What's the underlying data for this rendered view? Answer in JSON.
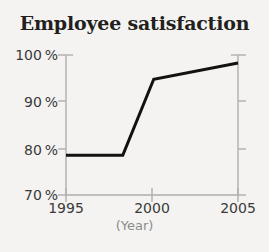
{
  "chart_data": {
    "type": "line",
    "title": "Employee satisfaction",
    "xlabel": "(Year)",
    "ylabel": "",
    "xlim": [
      1995,
      2005
    ],
    "ylim": [
      70,
      100
    ],
    "xticks": [
      1995,
      2000,
      2005
    ],
    "xtick_labels": [
      "1995",
      "2000",
      "2005"
    ],
    "yticks": [
      70,
      80,
      90,
      100
    ],
    "ytick_labels": [
      "70 %",
      "80 %",
      "90 %",
      "100 %"
    ],
    "grid": false,
    "legend": null,
    "series": [
      {
        "name": "Employee satisfaction",
        "color": "#111111",
        "line_width": 3,
        "x": [
          1995,
          1998.3,
          2000.1,
          2005
        ],
        "values": [
          78.5,
          78.5,
          94.8,
          98.3
        ]
      }
    ]
  },
  "axes": {
    "line_color": "#b0aeac",
    "tick_color": "#b0aeac",
    "background": "#f4f3f1",
    "text_color": "#3a3a3a",
    "xlabel_color": "#8c8c8c",
    "title_color": "#231f20"
  }
}
